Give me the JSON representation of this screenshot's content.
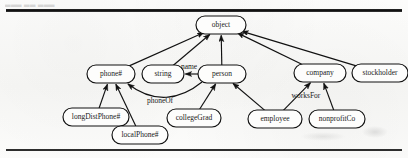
{
  "page": {
    "header_fragment": "▃▃▃ ▃▃ ▃▃▃",
    "rule_top_label": "top-rule",
    "rule_bottom_label": "bottom-rule"
  },
  "chart_data": {
    "type": "diagram",
    "title": "",
    "diagram_kind": "class-hierarchy",
    "nodes": [
      {
        "id": "object",
        "label": "object",
        "cx": 221,
        "cy": 25,
        "rx": 25,
        "ry": 9,
        "font": 7.5
      },
      {
        "id": "phone",
        "label": "phone#",
        "cx": 111,
        "cy": 74,
        "rx": 24,
        "ry": 9,
        "font": 7.5
      },
      {
        "id": "string",
        "label": "string",
        "cx": 163,
        "cy": 74,
        "rx": 21,
        "ry": 9,
        "font": 7.5
      },
      {
        "id": "person",
        "label": "person",
        "cx": 222,
        "cy": 74,
        "rx": 24,
        "ry": 9,
        "font": 7.5
      },
      {
        "id": "company",
        "label": "company",
        "cx": 320,
        "cy": 73,
        "rx": 26,
        "ry": 9,
        "font": 7.5
      },
      {
        "id": "stockholder",
        "label": "stockholder",
        "cx": 380,
        "cy": 73,
        "rx": 28,
        "ry": 9,
        "font": 7.5
      },
      {
        "id": "longDistPhone",
        "label": "longDistPhone#",
        "cx": 96,
        "cy": 117,
        "rx": 33,
        "ry": 9,
        "font": 7.5
      },
      {
        "id": "localPhone",
        "label": "localPhone#",
        "cx": 140,
        "cy": 135,
        "rx": 28,
        "ry": 9,
        "font": 7.5
      },
      {
        "id": "collegeGrad",
        "label": "collegeGrad",
        "cx": 194,
        "cy": 118,
        "rx": 27,
        "ry": 9,
        "font": 7.5
      },
      {
        "id": "employee",
        "label": "employee",
        "cx": 275,
        "cy": 119,
        "rx": 27,
        "ry": 9,
        "font": 7.5
      },
      {
        "id": "nonprofitCo",
        "label": "nonprofitCo",
        "cx": 337,
        "cy": 119,
        "rx": 28,
        "ry": 9,
        "font": 7.5
      }
    ],
    "edges": [
      {
        "id": "phone-object",
        "from": "phone",
        "to": "object",
        "label": "",
        "kind": "isa"
      },
      {
        "id": "string-object",
        "from": "string",
        "to": "object",
        "label": "",
        "kind": "isa"
      },
      {
        "id": "person-object",
        "from": "person",
        "to": "object",
        "label": "",
        "kind": "isa"
      },
      {
        "id": "company-object",
        "from": "company",
        "to": "object",
        "label": "",
        "kind": "isa"
      },
      {
        "id": "stockholder-object",
        "from": "stockholder",
        "to": "object",
        "label": "",
        "kind": "isa"
      },
      {
        "id": "person-string",
        "from": "person",
        "to": "string",
        "label": "name",
        "kind": "attribute"
      },
      {
        "id": "person-phone",
        "from": "person",
        "to": "phone",
        "label": "phoneOf",
        "kind": "attribute"
      },
      {
        "id": "longDistPhone-phone",
        "from": "longDistPhone",
        "to": "phone",
        "label": "",
        "kind": "isa"
      },
      {
        "id": "localPhone-phone",
        "from": "localPhone",
        "to": "phone",
        "label": "",
        "kind": "isa"
      },
      {
        "id": "collegeGrad-person",
        "from": "collegeGrad",
        "to": "person",
        "label": "",
        "kind": "isa"
      },
      {
        "id": "employee-person",
        "from": "employee",
        "to": "person",
        "label": "",
        "kind": "isa"
      },
      {
        "id": "employee-company",
        "from": "employee",
        "to": "company",
        "label": "worksFor",
        "kind": "attribute"
      },
      {
        "id": "nonprofitCo-company",
        "from": "nonprofitCo",
        "to": "company",
        "label": "",
        "kind": "isa"
      }
    ],
    "edge_labels": [
      {
        "id": "name",
        "text": "name",
        "x": 189,
        "y": 67
      },
      {
        "id": "phoneOf",
        "text": "phoneOf",
        "x": 160,
        "y": 101
      },
      {
        "id": "worksFor",
        "text": "worksFor",
        "x": 306,
        "y": 96
      }
    ],
    "colors": {
      "ink": "#111111",
      "paper": "#fbfbfa",
      "node_fill": "#fdfdfc"
    }
  }
}
